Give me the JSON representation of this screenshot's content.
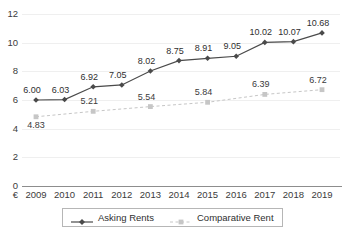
{
  "chart_data": {
    "type": "line",
    "title": "",
    "xlabel": "",
    "ylabel": "€",
    "categories": [
      "2009",
      "2010",
      "2011",
      "2012",
      "2013",
      "2014",
      "2015",
      "2016",
      "2017",
      "2018",
      "2019"
    ],
    "ylim": [
      0,
      12
    ],
    "y_ticks": [
      "0",
      "2",
      "4",
      "6",
      "8",
      "10",
      "12"
    ],
    "grid": true,
    "legend_position": "bottom",
    "series": [
      {
        "name": "Asking Rents",
        "color": "#4a4a4a",
        "style": "solid",
        "marker": "diamond",
        "values": [
          6.0,
          6.03,
          6.92,
          7.05,
          8.02,
          8.75,
          8.91,
          9.05,
          10.02,
          10.07,
          10.68
        ],
        "labels": [
          "6.00",
          "6.03",
          "6.92",
          "7.05",
          "8.02",
          "8.75",
          "8.91",
          "9.05",
          "10.02",
          "10.07",
          "10.68"
        ]
      },
      {
        "name": "Comparative Rent",
        "color": "#c6c6c6",
        "style": "dashed",
        "marker": "square",
        "values": [
          4.83,
          null,
          5.21,
          null,
          5.54,
          null,
          5.84,
          null,
          6.39,
          null,
          6.72
        ],
        "labels": [
          "4.83",
          "",
          "5.21",
          "",
          "5.54",
          "",
          "5.84",
          "",
          "6.39",
          "",
          "6.72"
        ]
      }
    ]
  },
  "axis": {
    "currency_symbol": "€"
  },
  "legend": {
    "items": [
      {
        "label": "Asking Rents"
      },
      {
        "label": "Comparative Rent"
      }
    ]
  }
}
